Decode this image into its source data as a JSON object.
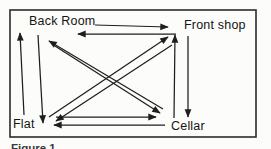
{
  "figure": {
    "caption": "Figure 1",
    "background": "#fcfcfa",
    "line_color": "#1e1e1e"
  },
  "diagram": {
    "nodes": [
      {
        "id": "back-room",
        "label": "Back Room",
        "x": 29,
        "y": 15
      },
      {
        "id": "front-shop",
        "label": "Front shop",
        "x": 184,
        "y": 19
      },
      {
        "id": "flat",
        "label": "Flat",
        "x": 13,
        "y": 118
      },
      {
        "id": "cellar",
        "label": "Cellar",
        "x": 171,
        "y": 120
      }
    ],
    "edges": [
      {
        "from": "back-room",
        "to": "front-shop",
        "x1": 95,
        "y1": 25,
        "x2": 168,
        "y2": 27
      },
      {
        "from": "front-shop",
        "to": "back-room",
        "x1": 176,
        "y1": 34,
        "x2": 78,
        "y2": 34
      },
      {
        "from": "flat",
        "to": "back-room",
        "x1": 24,
        "y1": 115,
        "x2": 20,
        "y2": 33
      },
      {
        "from": "back-room",
        "to": "flat",
        "x1": 38,
        "y1": 35,
        "x2": 43,
        "y2": 123
      },
      {
        "from": "cellar",
        "to": "front-shop",
        "x1": 174,
        "y1": 118,
        "x2": 175,
        "y2": 35
      },
      {
        "from": "front-shop",
        "to": "cellar",
        "x1": 188,
        "y1": 36,
        "x2": 188,
        "y2": 117
      },
      {
        "from": "cellar",
        "to": "back-room",
        "x1": 163,
        "y1": 109,
        "x2": 49,
        "y2": 41
      },
      {
        "from": "back-room",
        "to": "cellar",
        "x1": 55,
        "y1": 46,
        "x2": 160,
        "y2": 113
      },
      {
        "from": "flat",
        "to": "front-shop",
        "x1": 49,
        "y1": 117,
        "x2": 168,
        "y2": 37
      },
      {
        "from": "front-shop",
        "to": "flat",
        "x1": 172,
        "y1": 45,
        "x2": 56,
        "y2": 121
      },
      {
        "from": "flat",
        "to": "cellar",
        "x1": 56,
        "y1": 117,
        "x2": 156,
        "y2": 117
      },
      {
        "from": "cellar",
        "to": "flat",
        "x1": 165,
        "y1": 125,
        "x2": 54,
        "y2": 125
      }
    ]
  }
}
